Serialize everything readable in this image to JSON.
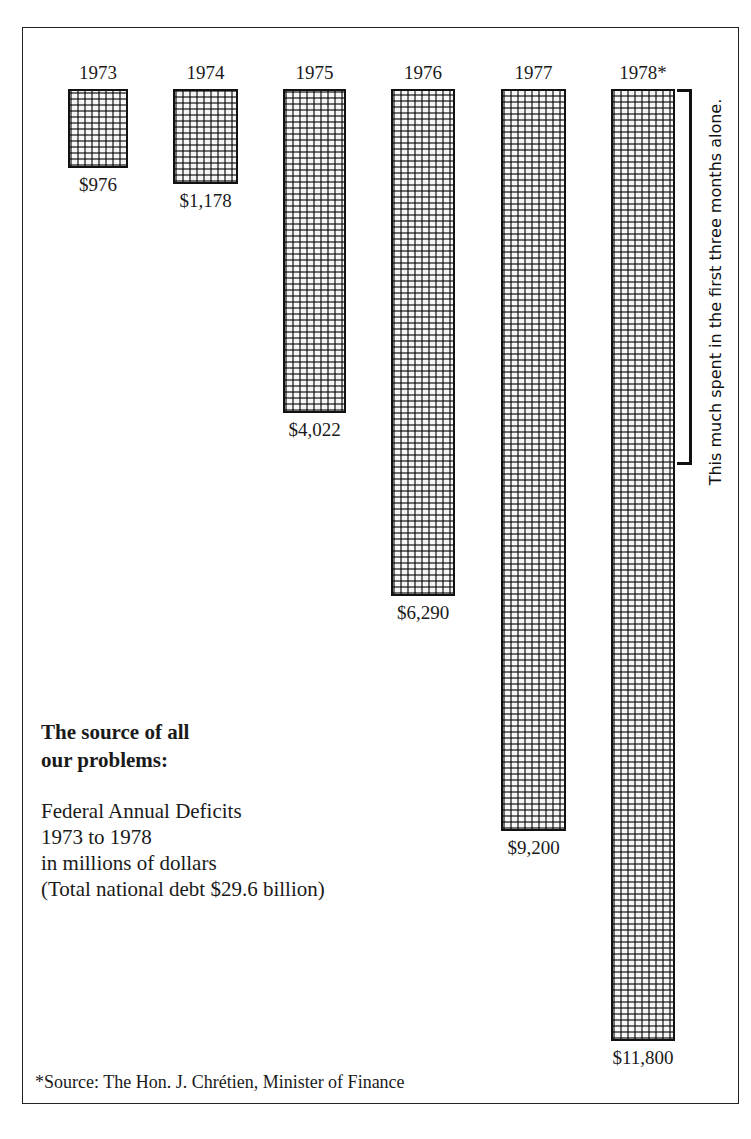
{
  "chart_data": {
    "type": "bar",
    "orientation": "vertical, bars hanging downward from common top",
    "categories": [
      "1973",
      "1974",
      "1975",
      "1976",
      "1977",
      "1978*"
    ],
    "values": [
      976,
      1178,
      4022,
      6290,
      9200,
      11800
    ],
    "value_labels": [
      "$976",
      "$1,178",
      "$4,022",
      "$6,290",
      "$9,200",
      "$11,800"
    ],
    "title": "The source of all our problems:",
    "subtitle": [
      "Federal Annual Deficits",
      "1973 to 1978",
      "in millions of dollars",
      "(Total national debt $29.6 billion)"
    ],
    "xlabel": "",
    "ylabel": "",
    "units": "millions of dollars",
    "grid": false,
    "legend": null,
    "annotations": [
      {
        "target": "1978*",
        "type": "bracket",
        "text": "This much spent in the first three months alone."
      }
    ],
    "footnote": "*Source: The Hon. J. Chrétien, Minister of Finance"
  },
  "title_lines": [
    "The source of all",
    "our problems:"
  ],
  "desc_lines": [
    "Federal Annual Deficits",
    "1973 to 1978",
    "in millions of dollars",
    "(Total national debt $29.6 billion)"
  ],
  "bracket_note": "This much spent in the first three months alone.",
  "footnote": "*Source: The Hon. J. Chrétien, Minister of Finance"
}
